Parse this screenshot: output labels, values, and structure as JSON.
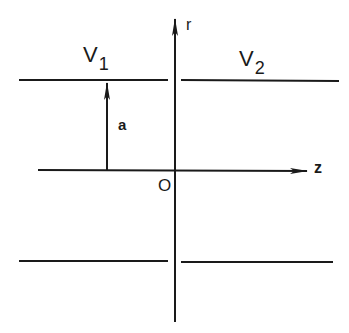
{
  "diagram": {
    "type": "cylindrical-waveguide-junction",
    "axes": {
      "vertical": {
        "label": "r"
      },
      "horizontal": {
        "label": "z"
      },
      "origin_label": "O"
    },
    "regions": [
      {
        "name": "V",
        "subscript": "1",
        "side": "left"
      },
      {
        "name": "V",
        "subscript": "2",
        "side": "right"
      }
    ],
    "radius_label": "a",
    "colors": {
      "stroke": "#1a1a1a",
      "background": "#ffffff"
    }
  }
}
